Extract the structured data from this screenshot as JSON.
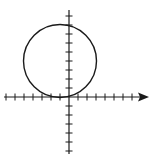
{
  "diagram": {
    "type": "coordinate-plane-graph",
    "colors": {
      "stroke": "#1a1a1a",
      "background": "#ffffff"
    },
    "axes": {
      "x": {
        "min_tick": -7,
        "max_tick": 7,
        "arrow": "right"
      },
      "y": {
        "min_tick": -6,
        "max_tick": 9,
        "arrow": "none"
      },
      "tick_spacing_units": 1
    },
    "circle": {
      "center": [
        -1,
        4
      ],
      "radius": 4,
      "tangent_to": "x-axis"
    }
  },
  "chart_data": {
    "type": "scatter",
    "title": "",
    "xlabel": "",
    "ylabel": "",
    "xlim": [
      -7,
      8
    ],
    "ylim": [
      -6,
      9
    ],
    "grid": false,
    "shapes": [
      {
        "kind": "circle",
        "center": [
          -1,
          4
        ],
        "radius": 4
      }
    ]
  }
}
